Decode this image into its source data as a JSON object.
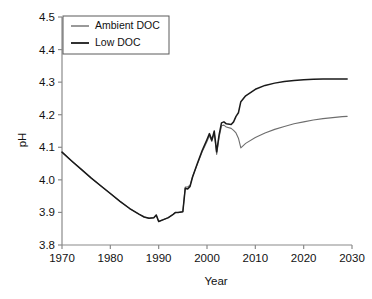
{
  "chart_data": {
    "type": "line",
    "title": "",
    "xlabel": "Year",
    "ylabel": "pH",
    "xlim": [
      1970,
      2030
    ],
    "ylim": [
      3.8,
      4.5
    ],
    "grid": false,
    "legend_position": "top-left",
    "xticks": [
      1970,
      1980,
      1990,
      2000,
      2010,
      2020,
      2030
    ],
    "xtick_labels": [
      "1970",
      "1980",
      "1990",
      "2000",
      "2010",
      "2020",
      "2030"
    ],
    "yticks": [
      3.8,
      3.9,
      4.0,
      4.1,
      4.2,
      4.3,
      4.4,
      4.5
    ],
    "ytick_labels": [
      "3.8",
      "3.9",
      "4.0",
      "4.1",
      "4.2",
      "4.3",
      "4.4",
      "4.5"
    ],
    "series": [
      {
        "name": "Ambient DOC",
        "color": "#6e6e6e",
        "x": [
          1970,
          1972,
          1974,
          1976,
          1978,
          1980,
          1982,
          1984,
          1986,
          1987,
          1988,
          1989,
          1989.5,
          1990,
          1991,
          1992,
          1993,
          1993.5,
          1994,
          1995,
          1995.5,
          1996,
          1996.5,
          1997,
          1998,
          1999,
          2000,
          2000.5,
          2001,
          2001.5,
          2002,
          2002.5,
          2003,
          2003.5,
          2004,
          2005,
          2005.5,
          2006,
          2006.5,
          2007,
          2008,
          2010,
          2012,
          2014,
          2016,
          2018,
          2020,
          2022,
          2024,
          2026,
          2028,
          2029
        ],
        "y": [
          4.085,
          4.058,
          4.032,
          4.006,
          3.982,
          3.958,
          3.934,
          3.912,
          3.894,
          3.886,
          3.882,
          3.884,
          3.892,
          3.872,
          3.878,
          3.884,
          3.894,
          3.9,
          3.9,
          3.902,
          3.978,
          3.978,
          3.984,
          4.01,
          4.048,
          4.086,
          4.118,
          4.136,
          4.118,
          4.144,
          4.078,
          4.13,
          4.166,
          4.168,
          4.162,
          4.158,
          4.152,
          4.144,
          4.128,
          4.098,
          4.112,
          4.13,
          4.144,
          4.155,
          4.164,
          4.172,
          4.178,
          4.184,
          4.188,
          4.191,
          4.194,
          4.195
        ]
      },
      {
        "name": "Low DOC",
        "color": "#1a1a1a",
        "x": [
          1970,
          1972,
          1974,
          1976,
          1978,
          1980,
          1982,
          1984,
          1986,
          1987,
          1988,
          1989,
          1989.5,
          1990,
          1991,
          1992,
          1993,
          1993.5,
          1994,
          1995,
          1995.5,
          1996,
          1996.5,
          1997,
          1998,
          1999,
          2000,
          2000.5,
          2001,
          2001.5,
          2002,
          2002.5,
          2003,
          2003.5,
          2004,
          2005,
          2005.5,
          2006,
          2006.5,
          2007,
          2008,
          2010,
          2012,
          2014,
          2016,
          2018,
          2020,
          2022,
          2024,
          2026,
          2028,
          2029
        ],
        "y": [
          4.085,
          4.058,
          4.032,
          4.006,
          3.982,
          3.958,
          3.934,
          3.912,
          3.894,
          3.886,
          3.882,
          3.884,
          3.892,
          3.872,
          3.878,
          3.884,
          3.894,
          3.9,
          3.9,
          3.902,
          3.974,
          3.972,
          3.98,
          4.008,
          4.05,
          4.09,
          4.124,
          4.142,
          4.122,
          4.15,
          4.086,
          4.138,
          4.175,
          4.178,
          4.172,
          4.17,
          4.178,
          4.195,
          4.206,
          4.24,
          4.258,
          4.278,
          4.29,
          4.297,
          4.302,
          4.305,
          4.307,
          4.309,
          4.31,
          4.31,
          4.31,
          4.31
        ]
      }
    ],
    "annotations": []
  },
  "legend": {
    "entries": [
      {
        "label": "Ambient DOC",
        "color": "#6e6e6e"
      },
      {
        "label": "Low DOC",
        "color": "#1a1a1a"
      }
    ]
  }
}
